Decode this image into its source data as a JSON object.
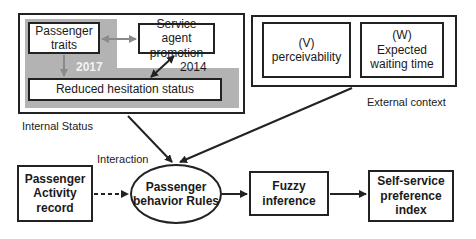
{
  "internal_status": {
    "group_label": "Internal Status",
    "passenger_traits": "Passenger traits",
    "service_agent_promotion": "Service agent promotion",
    "reduced_hesitation_status": "Reduced hesitation status",
    "year_left": "2017",
    "year_right": "2014"
  },
  "external_context": {
    "group_label": "External context",
    "perceivability_code": "(V)",
    "perceivability": "perceivability",
    "waiting_time_code": "(W)",
    "waiting_time": "Expected waiting time"
  },
  "flow": {
    "interaction_label": "Interaction",
    "activity_record": "Passenger Activity record",
    "behavior_rules": "Passenger behavior Rules",
    "fuzzy_inference": "Fuzzy inference",
    "preference_index": "Self-service preference index"
  },
  "colors": {
    "gray_region": "#b3b3b3",
    "line": "#222222",
    "gray_arrow": "#8a8a8a"
  }
}
